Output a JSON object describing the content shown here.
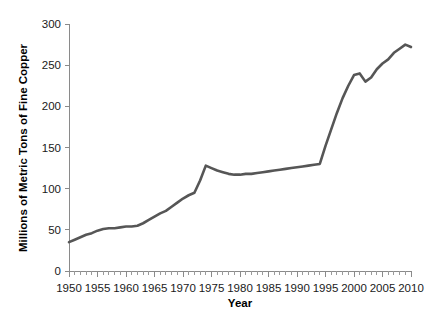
{
  "chart_data": {
    "type": "line",
    "title": "",
    "xlabel": "Year",
    "ylabel": "Millions of Metric Tons of Fine Copper",
    "xlim": [
      1950,
      2010
    ],
    "ylim": [
      0,
      300
    ],
    "xticks": [
      1950,
      1955,
      1960,
      1965,
      1970,
      1975,
      1980,
      1985,
      1990,
      1995,
      2000,
      2005,
      2010
    ],
    "yticks": [
      0,
      50,
      100,
      150,
      200,
      250,
      300
    ],
    "xtick_labels": [
      "1950",
      "1955",
      "1960",
      "1965",
      "1970",
      "1975",
      "1980",
      "1985",
      "1990",
      "1995",
      "2000",
      "2005",
      "2010"
    ],
    "ytick_labels": [
      "0",
      "50",
      "100",
      "150",
      "200",
      "250",
      "300"
    ],
    "x_minor_step": 1,
    "grid": false,
    "legend": "none",
    "line_color": "#565656",
    "series": [
      {
        "name": "World copper production",
        "x": [
          1950,
          1951,
          1952,
          1953,
          1954,
          1955,
          1956,
          1957,
          1958,
          1959,
          1960,
          1961,
          1962,
          1963,
          1964,
          1965,
          1966,
          1967,
          1968,
          1969,
          1970,
          1971,
          1972,
          1973,
          1974,
          1975,
          1976,
          1977,
          1978,
          1979,
          1980,
          1981,
          1982,
          1983,
          1984,
          1985,
          1986,
          1987,
          1988,
          1989,
          1990,
          1991,
          1992,
          1993,
          1994,
          1995,
          1996,
          1997,
          1998,
          1999,
          2000,
          2001,
          2002,
          2003,
          2004,
          2005,
          2006,
          2007,
          2008,
          2009,
          2010
        ],
        "values": [
          35,
          38,
          41,
          44,
          46,
          49,
          51,
          52,
          52,
          53,
          54,
          54,
          55,
          58,
          62,
          66,
          70,
          73,
          78,
          83,
          88,
          92,
          95,
          110,
          128,
          125,
          122,
          120,
          118,
          117,
          117,
          118,
          118,
          119,
          120,
          121,
          122,
          123,
          124,
          125,
          126,
          127,
          128,
          129,
          130,
          152,
          172,
          192,
          210,
          225,
          238,
          240,
          230,
          235,
          245,
          252,
          257,
          265,
          270,
          275,
          272
        ]
      }
    ]
  },
  "axis": {
    "x_title": "Year",
    "y_title": "Millions of Metric Tons of Fine Copper"
  }
}
